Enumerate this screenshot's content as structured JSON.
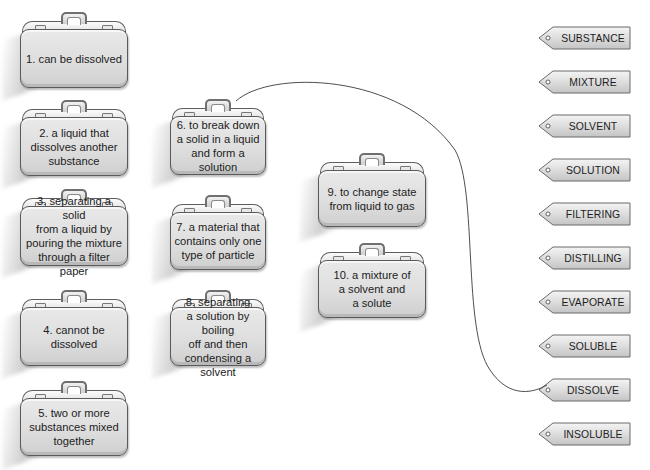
{
  "definitions": [
    {
      "id": 1,
      "text": "1. can be dissolved"
    },
    {
      "id": 2,
      "text": "2. a liquid that\ndissolves another\nsubstance"
    },
    {
      "id": 3,
      "text": "3. separating a solid\nfrom a liquid by\npouring the mixture\nthrough a filter paper"
    },
    {
      "id": 4,
      "text": "4. cannot be\ndissolved"
    },
    {
      "id": 5,
      "text": "5. two or more\nsubstances mixed\ntogether"
    },
    {
      "id": 6,
      "text": "6. to break down\na solid in a liquid\nand form a solution"
    },
    {
      "id": 7,
      "text": "7. a material that\ncontains only one\ntype of particle"
    },
    {
      "id": 8,
      "text": "8. separating\na solution by boiling\noff and then\ncondensing a solvent"
    },
    {
      "id": 9,
      "text": "9. to change state\nfrom liquid to gas"
    },
    {
      "id": 10,
      "text": "10. a mixture of\na solvent and\na solute"
    }
  ],
  "terms": [
    {
      "label": "SUBSTANCE"
    },
    {
      "label": "MIXTURE"
    },
    {
      "label": "SOLVENT"
    },
    {
      "label": "SOLUTION"
    },
    {
      "label": "FILTERING"
    },
    {
      "label": "DISTILLING"
    },
    {
      "label": "EVAPORATE"
    },
    {
      "label": "SOLUBLE"
    },
    {
      "label": "DISSOLVE"
    },
    {
      "label": "INSOLUBLE"
    }
  ],
  "connections": [
    {
      "definition": 6,
      "term": "DISSOLVE"
    }
  ],
  "colors": {
    "suitcase_fill": "#e2e2e2",
    "suitcase_border": "#5a5a5a",
    "tag_fill": "#dcdcdc",
    "tag_border": "#6a6a6a",
    "connector_line": "#3a3a3a"
  }
}
